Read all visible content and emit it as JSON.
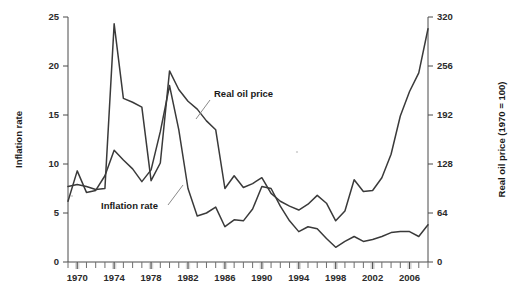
{
  "chart_data": {
    "type": "line",
    "title": "",
    "subtitle": "",
    "xlabel": "",
    "ylabel": "Inflation rate",
    "y2label": "Real oil price (1970 = 100)",
    "grid": false,
    "legend_position": "inline-annotations",
    "xlim": [
      1969,
      2008
    ],
    "ylim": [
      0,
      25
    ],
    "y2lim": [
      0,
      320
    ],
    "x_ticks_major": [
      1970,
      1974,
      1978,
      1982,
      1986,
      1990,
      1994,
      1998,
      2002,
      2006
    ],
    "x_tick_labels": [
      "1970",
      "1974",
      "1978",
      "1982",
      "1986",
      "1990",
      "1994",
      "1998",
      "2002",
      "2006"
    ],
    "x_ticks_minor": [
      1969,
      1971,
      1972,
      1973,
      1975,
      1976,
      1977,
      1979,
      1980,
      1981,
      1983,
      1984,
      1985,
      1987,
      1988,
      1989,
      1991,
      1992,
      1993,
      1995,
      1996,
      1997,
      1999,
      2000,
      2001,
      2003,
      2004,
      2005,
      2007,
      2008
    ],
    "y_ticks_left": [
      0,
      5,
      10,
      15,
      20,
      25
    ],
    "y_tick_labels_left": [
      "0",
      "5",
      "10",
      "15",
      "20",
      "25"
    ],
    "y_ticks_right": [
      0,
      64,
      128,
      192,
      256,
      320
    ],
    "y_tick_labels_right": [
      "0",
      "64",
      "128",
      "192",
      "256",
      "320"
    ],
    "annotations": [
      {
        "name": "real-oil-price-label",
        "text": "Real oil price",
        "text_x": 214.0,
        "text_y": 97,
        "leader_from": [
          210.0,
          100
        ],
        "leader_to": [
          196,
          119
        ]
      },
      {
        "name": "inflation-rate-label",
        "text": "Inflation rate",
        "text_x": 101,
        "text_y": 209,
        "leader_from": [
          168,
          205
        ],
        "leader_to": [
          183,
          185
        ]
      }
    ],
    "series": [
      {
        "name": "Inflation rate",
        "axis": "left",
        "color": "#3a3a3a",
        "x": [
          1969,
          1970,
          1971,
          1972,
          1973,
          1974,
          1975,
          1976,
          1977,
          1978,
          1979,
          1980,
          1981,
          1982,
          1983,
          1984,
          1985,
          1986,
          1987,
          1988,
          1989,
          1990,
          1991,
          1992,
          1993,
          1994,
          1995,
          1996,
          1997,
          1998,
          1999,
          2000,
          2001,
          2002,
          2003,
          2004,
          2005,
          2006,
          2007,
          2008
        ],
        "y": [
          6.2,
          9.3,
          7.1,
          7.3,
          8.8,
          11.4,
          10.4,
          9.5,
          8.2,
          9.4,
          13.3,
          18.0,
          13.5,
          7.5,
          4.7,
          5.0,
          5.6,
          3.6,
          4.3,
          4.2,
          5.4,
          7.7,
          7.5,
          5.7,
          4.2,
          3.1,
          3.6,
          3.4,
          2.4,
          1.5,
          2.1,
          2.6,
          2.1,
          2.3,
          2.6,
          3.0,
          3.1,
          3.1,
          2.6,
          3.8
        ]
      },
      {
        "name": "Real oil price",
        "axis": "right",
        "color": "#3a3a3a",
        "x": [
          1969,
          1970,
          1971,
          1972,
          1973,
          1974,
          1975,
          1976,
          1977,
          1978,
          1979,
          1980,
          1981,
          1982,
          1983,
          1984,
          1985,
          1986,
          1987,
          1988,
          1989,
          1990,
          1991,
          1992,
          1993,
          1994,
          1995,
          1996,
          1997,
          1998,
          1999,
          2000,
          2001,
          2002,
          2003,
          2004,
          2005,
          2006,
          2007,
          2008
        ],
        "y_left_scale": [
          7.7,
          7.9,
          7.7,
          7.4,
          7.5,
          24.3,
          16.7,
          16.3,
          15.8,
          8.3,
          10.1,
          19.5,
          17.6,
          16.4,
          15.6,
          14.4,
          13.5,
          7.5,
          8.8,
          7.6,
          8.0,
          8.6,
          7.0,
          6.2,
          5.7,
          5.3,
          5.9,
          6.8,
          6.0,
          4.2,
          5.2,
          8.4,
          7.2,
          7.3,
          8.6,
          11.0,
          14.9,
          17.4,
          19.3,
          23.8
        ],
        "y": [
          98,
          101,
          99,
          95,
          96,
          311,
          214,
          209,
          202,
          106,
          129,
          250,
          225,
          210,
          200,
          184,
          173,
          96,
          113,
          97,
          102,
          110,
          90,
          79,
          73,
          68,
          76,
          87,
          77,
          54,
          67,
          108,
          92,
          93,
          110,
          141,
          191,
          223,
          247,
          305
        ]
      }
    ]
  }
}
